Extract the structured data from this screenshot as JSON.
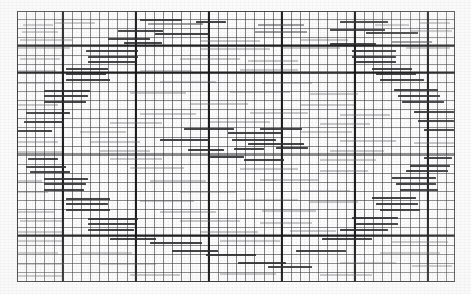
{
  "document": {
    "title": "Graph paper scan",
    "description": "Scanned engineering graph paper with hand-drawn horizontal step segments",
    "media_type": "scanned-image",
    "width": 471,
    "height": 294
  },
  "colors": {
    "background": "#fcfcfc",
    "minor_gridline": "#37373a",
    "major_gridline": "#121214",
    "segment_dark": "#2b2b2e",
    "segment_light": "#4a4a4e",
    "segment_faint": "#5c5c60"
  },
  "grid": {
    "plate_left": 17,
    "plate_top": 11,
    "plate_width": 438,
    "plate_height": 271,
    "minor_cell_w": 9.13,
    "minor_cell_h": 9.03,
    "major_cell_w": 73.05,
    "major_cell_h": 81.3,
    "major_offset_x": 44.9,
    "major_offset_y": 35.5
  },
  "chart_data": {
    "type": "line",
    "title": "",
    "xlabel": "",
    "ylabel": "",
    "grid": true,
    "legend": "none",
    "xlim": [
      0,
      48
    ],
    "ylim": [
      0,
      30
    ],
    "series": [
      {
        "name": "upper-staircase",
        "steps": [
          {
            "x0": 2,
            "x1": 7,
            "y": 26
          },
          {
            "x0": 3,
            "x1": 8,
            "y": 25
          },
          {
            "x0": 5,
            "x1": 10,
            "y": 24
          },
          {
            "x0": 7,
            "x1": 12,
            "y": 23
          },
          {
            "x0": 9,
            "x1": 14,
            "y": 22
          },
          {
            "x0": 11,
            "x1": 17,
            "y": 21
          },
          {
            "x0": 13,
            "x1": 19,
            "y": 20
          },
          {
            "x0": 16,
            "x1": 22,
            "y": 19
          },
          {
            "x0": 19,
            "x1": 25,
            "y": 18
          },
          {
            "x0": 21,
            "x1": 27,
            "y": 17
          },
          {
            "x0": 24,
            "x1": 30,
            "y": 16
          },
          {
            "x0": 27,
            "x1": 33,
            "y": 15
          },
          {
            "x0": 30,
            "x1": 36,
            "y": 14
          }
        ]
      },
      {
        "name": "plateau",
        "steps": [
          {
            "x0": 33,
            "x1": 41,
            "y": 13
          },
          {
            "x0": 36,
            "x1": 44,
            "y": 12
          }
        ]
      },
      {
        "name": "descending-staircase",
        "steps": [
          {
            "x0": 28,
            "x1": 34,
            "y": 11
          },
          {
            "x0": 31,
            "x1": 37,
            "y": 10
          },
          {
            "x0": 34,
            "x1": 40,
            "y": 9
          },
          {
            "x0": 37,
            "x1": 43,
            "y": 8
          },
          {
            "x0": 40,
            "x1": 46,
            "y": 7
          }
        ]
      }
    ]
  },
  "segments": [
    {
      "x": 23,
      "y": 24,
      "w": 30,
      "h": 2,
      "tone": "faint"
    },
    {
      "x": 55,
      "y": 22,
      "w": 40,
      "h": 2,
      "tone": "faint"
    },
    {
      "x": 140,
      "y": 19,
      "w": 42,
      "h": 2,
      "tone": "dark"
    },
    {
      "x": 148,
      "y": 23,
      "w": 55,
      "h": 2,
      "tone": "light"
    },
    {
      "x": 196,
      "y": 21,
      "w": 30,
      "h": 2,
      "tone": "dark"
    },
    {
      "x": 258,
      "y": 24,
      "w": 46,
      "h": 2,
      "tone": "light"
    },
    {
      "x": 340,
      "y": 21,
      "w": 48,
      "h": 2,
      "tone": "dark"
    },
    {
      "x": 375,
      "y": 24,
      "w": 34,
      "h": 2,
      "tone": "faint"
    },
    {
      "x": 420,
      "y": 22,
      "w": 30,
      "h": 2,
      "tone": "faint"
    },
    {
      "x": 22,
      "y": 31,
      "w": 36,
      "h": 2,
      "tone": "faint"
    },
    {
      "x": 118,
      "y": 30,
      "w": 45,
      "h": 2,
      "tone": "dark"
    },
    {
      "x": 155,
      "y": 33,
      "w": 54,
      "h": 2,
      "tone": "dark"
    },
    {
      "x": 255,
      "y": 31,
      "w": 52,
      "h": 2,
      "tone": "light"
    },
    {
      "x": 330,
      "y": 29,
      "w": 55,
      "h": 2,
      "tone": "dark"
    },
    {
      "x": 366,
      "y": 32,
      "w": 52,
      "h": 2,
      "tone": "dark"
    },
    {
      "x": 410,
      "y": 30,
      "w": 42,
      "h": 2,
      "tone": "faint"
    },
    {
      "x": 20,
      "y": 39,
      "w": 52,
      "h": 2,
      "tone": "faint"
    },
    {
      "x": 108,
      "y": 38,
      "w": 42,
      "h": 2,
      "tone": "dark"
    },
    {
      "x": 124,
      "y": 42,
      "w": 38,
      "h": 2,
      "tone": "dark"
    },
    {
      "x": 200,
      "y": 40,
      "w": 60,
      "h": 2,
      "tone": "faint"
    },
    {
      "x": 300,
      "y": 39,
      "w": 48,
      "h": 2,
      "tone": "faint"
    },
    {
      "x": 330,
      "y": 43,
      "w": 46,
      "h": 2,
      "tone": "dark"
    },
    {
      "x": 392,
      "y": 41,
      "w": 40,
      "h": 2,
      "tone": "light"
    },
    {
      "x": 18,
      "y": 47,
      "w": 52,
      "h": 2,
      "tone": "faint"
    },
    {
      "x": 86,
      "y": 50,
      "w": 52,
      "h": 2,
      "tone": "dark"
    },
    {
      "x": 200,
      "y": 48,
      "w": 70,
      "h": 2,
      "tone": "faint"
    },
    {
      "x": 282,
      "y": 47,
      "w": 58,
      "h": 2,
      "tone": "faint"
    },
    {
      "x": 352,
      "y": 50,
      "w": 44,
      "h": 2,
      "tone": "dark"
    },
    {
      "x": 406,
      "y": 47,
      "w": 44,
      "h": 2,
      "tone": "faint"
    },
    {
      "x": 88,
      "y": 56,
      "w": 50,
      "h": 2,
      "tone": "dark"
    },
    {
      "x": 352,
      "y": 56,
      "w": 44,
      "h": 2,
      "tone": "dark"
    },
    {
      "x": 88,
      "y": 61,
      "w": 48,
      "h": 2,
      "tone": "dark"
    },
    {
      "x": 356,
      "y": 61,
      "w": 40,
      "h": 2,
      "tone": "dark"
    },
    {
      "x": 20,
      "y": 58,
      "w": 40,
      "h": 2,
      "tone": "faint"
    },
    {
      "x": 180,
      "y": 58,
      "w": 60,
      "h": 2,
      "tone": "faint"
    },
    {
      "x": 248,
      "y": 60,
      "w": 50,
      "h": 2,
      "tone": "faint"
    },
    {
      "x": 66,
      "y": 68,
      "w": 42,
      "h": 2,
      "tone": "dark"
    },
    {
      "x": 66,
      "y": 73,
      "w": 40,
      "h": 2,
      "tone": "dark"
    },
    {
      "x": 372,
      "y": 68,
      "w": 40,
      "h": 2,
      "tone": "dark"
    },
    {
      "x": 376,
      "y": 73,
      "w": 40,
      "h": 2,
      "tone": "dark"
    },
    {
      "x": 18,
      "y": 70,
      "w": 38,
      "h": 2,
      "tone": "faint"
    },
    {
      "x": 140,
      "y": 70,
      "w": 52,
      "h": 2,
      "tone": "faint"
    },
    {
      "x": 240,
      "y": 69,
      "w": 58,
      "h": 2,
      "tone": "faint"
    },
    {
      "x": 300,
      "y": 72,
      "w": 46,
      "h": 2,
      "tone": "faint"
    },
    {
      "x": 66,
      "y": 79,
      "w": 44,
      "h": 2,
      "tone": "dark"
    },
    {
      "x": 380,
      "y": 79,
      "w": 44,
      "h": 2,
      "tone": "dark"
    },
    {
      "x": 18,
      "y": 82,
      "w": 44,
      "h": 2,
      "tone": "faint"
    },
    {
      "x": 160,
      "y": 81,
      "w": 56,
      "h": 2,
      "tone": "faint"
    },
    {
      "x": 262,
      "y": 82,
      "w": 50,
      "h": 2,
      "tone": "faint"
    },
    {
      "x": 44,
      "y": 90,
      "w": 46,
      "h": 2,
      "tone": "dark"
    },
    {
      "x": 394,
      "y": 89,
      "w": 44,
      "h": 2,
      "tone": "dark"
    },
    {
      "x": 44,
      "y": 95,
      "w": 44,
      "h": 2,
      "tone": "dark"
    },
    {
      "x": 398,
      "y": 95,
      "w": 42,
      "h": 2,
      "tone": "dark"
    },
    {
      "x": 130,
      "y": 92,
      "w": 56,
      "h": 2,
      "tone": "faint"
    },
    {
      "x": 230,
      "y": 91,
      "w": 60,
      "h": 2,
      "tone": "faint"
    },
    {
      "x": 310,
      "y": 93,
      "w": 48,
      "h": 2,
      "tone": "faint"
    },
    {
      "x": 44,
      "y": 101,
      "w": 42,
      "h": 2,
      "tone": "dark"
    },
    {
      "x": 402,
      "y": 101,
      "w": 42,
      "h": 2,
      "tone": "dark"
    },
    {
      "x": 18,
      "y": 104,
      "w": 40,
      "h": 2,
      "tone": "faint"
    },
    {
      "x": 190,
      "y": 103,
      "w": 58,
      "h": 2,
      "tone": "faint"
    },
    {
      "x": 300,
      "y": 104,
      "w": 54,
      "h": 2,
      "tone": "faint"
    },
    {
      "x": 26,
      "y": 112,
      "w": 44,
      "h": 2,
      "tone": "dark"
    },
    {
      "x": 414,
      "y": 111,
      "w": 40,
      "h": 2,
      "tone": "dark"
    },
    {
      "x": 140,
      "y": 113,
      "w": 56,
      "h": 2,
      "tone": "faint"
    },
    {
      "x": 250,
      "y": 112,
      "w": 58,
      "h": 2,
      "tone": "faint"
    },
    {
      "x": 340,
      "y": 114,
      "w": 50,
      "h": 2,
      "tone": "faint"
    },
    {
      "x": 24,
      "y": 121,
      "w": 40,
      "h": 2,
      "tone": "dark"
    },
    {
      "x": 418,
      "y": 120,
      "w": 36,
      "h": 2,
      "tone": "dark"
    },
    {
      "x": 110,
      "y": 122,
      "w": 52,
      "h": 2,
      "tone": "faint"
    },
    {
      "x": 210,
      "y": 121,
      "w": 60,
      "h": 2,
      "tone": "faint"
    },
    {
      "x": 320,
      "y": 123,
      "w": 50,
      "h": 2,
      "tone": "faint"
    },
    {
      "x": 18,
      "y": 130,
      "w": 34,
      "h": 2,
      "tone": "dark"
    },
    {
      "x": 184,
      "y": 128,
      "w": 50,
      "h": 2,
      "tone": "dark"
    },
    {
      "x": 228,
      "y": 132,
      "w": 54,
      "h": 2,
      "tone": "dark"
    },
    {
      "x": 260,
      "y": 128,
      "w": 42,
      "h": 2,
      "tone": "dark"
    },
    {
      "x": 424,
      "y": 129,
      "w": 30,
      "h": 2,
      "tone": "dark"
    },
    {
      "x": 80,
      "y": 131,
      "w": 46,
      "h": 2,
      "tone": "faint"
    },
    {
      "x": 300,
      "y": 131,
      "w": 52,
      "h": 2,
      "tone": "faint"
    },
    {
      "x": 160,
      "y": 139,
      "w": 50,
      "h": 2,
      "tone": "dark"
    },
    {
      "x": 232,
      "y": 139,
      "w": 44,
      "h": 2,
      "tone": "dark"
    },
    {
      "x": 248,
      "y": 143,
      "w": 56,
      "h": 2,
      "tone": "dark"
    },
    {
      "x": 18,
      "y": 141,
      "w": 40,
      "h": 2,
      "tone": "faint"
    },
    {
      "x": 90,
      "y": 141,
      "w": 50,
      "h": 2,
      "tone": "faint"
    },
    {
      "x": 340,
      "y": 140,
      "w": 56,
      "h": 2,
      "tone": "faint"
    },
    {
      "x": 414,
      "y": 142,
      "w": 40,
      "h": 2,
      "tone": "faint"
    },
    {
      "x": 188,
      "y": 149,
      "w": 36,
      "h": 2,
      "tone": "dark"
    },
    {
      "x": 234,
      "y": 148,
      "w": 30,
      "h": 2,
      "tone": "dark"
    },
    {
      "x": 276,
      "y": 147,
      "w": 32,
      "h": 2,
      "tone": "dark"
    },
    {
      "x": 18,
      "y": 151,
      "w": 44,
      "h": 2,
      "tone": "faint"
    },
    {
      "x": 100,
      "y": 150,
      "w": 50,
      "h": 2,
      "tone": "faint"
    },
    {
      "x": 330,
      "y": 150,
      "w": 54,
      "h": 2,
      "tone": "faint"
    },
    {
      "x": 210,
      "y": 156,
      "w": 34,
      "h": 2,
      "tone": "dark"
    },
    {
      "x": 244,
      "y": 159,
      "w": 40,
      "h": 2,
      "tone": "dark"
    },
    {
      "x": 28,
      "y": 158,
      "w": 30,
      "h": 2,
      "tone": "dark"
    },
    {
      "x": 424,
      "y": 157,
      "w": 28,
      "h": 2,
      "tone": "dark"
    },
    {
      "x": 110,
      "y": 158,
      "w": 52,
      "h": 2,
      "tone": "faint"
    },
    {
      "x": 320,
      "y": 159,
      "w": 56,
      "h": 2,
      "tone": "faint"
    },
    {
      "x": 26,
      "y": 166,
      "w": 40,
      "h": 2,
      "tone": "dark"
    },
    {
      "x": 30,
      "y": 171,
      "w": 40,
      "h": 2,
      "tone": "dark"
    },
    {
      "x": 410,
      "y": 165,
      "w": 40,
      "h": 2,
      "tone": "dark"
    },
    {
      "x": 406,
      "y": 170,
      "w": 42,
      "h": 2,
      "tone": "dark"
    },
    {
      "x": 130,
      "y": 167,
      "w": 54,
      "h": 2,
      "tone": "faint"
    },
    {
      "x": 240,
      "y": 168,
      "w": 58,
      "h": 2,
      "tone": "faint"
    },
    {
      "x": 320,
      "y": 170,
      "w": 48,
      "h": 2,
      "tone": "faint"
    },
    {
      "x": 44,
      "y": 178,
      "w": 44,
      "h": 2,
      "tone": "dark"
    },
    {
      "x": 392,
      "y": 177,
      "w": 44,
      "h": 2,
      "tone": "dark"
    },
    {
      "x": 44,
      "y": 183,
      "w": 42,
      "h": 2,
      "tone": "dark"
    },
    {
      "x": 396,
      "y": 183,
      "w": 40,
      "h": 2,
      "tone": "dark"
    },
    {
      "x": 18,
      "y": 180,
      "w": 24,
      "h": 2,
      "tone": "faint"
    },
    {
      "x": 150,
      "y": 180,
      "w": 56,
      "h": 2,
      "tone": "faint"
    },
    {
      "x": 260,
      "y": 179,
      "w": 58,
      "h": 2,
      "tone": "faint"
    },
    {
      "x": 44,
      "y": 189,
      "w": 40,
      "h": 2,
      "tone": "dark"
    },
    {
      "x": 400,
      "y": 189,
      "w": 38,
      "h": 2,
      "tone": "dark"
    },
    {
      "x": 18,
      "y": 191,
      "w": 30,
      "h": 2,
      "tone": "faint"
    },
    {
      "x": 180,
      "y": 191,
      "w": 56,
      "h": 2,
      "tone": "faint"
    },
    {
      "x": 300,
      "y": 190,
      "w": 50,
      "h": 2,
      "tone": "faint"
    },
    {
      "x": 66,
      "y": 198,
      "w": 44,
      "h": 2,
      "tone": "dark"
    },
    {
      "x": 372,
      "y": 197,
      "w": 44,
      "h": 2,
      "tone": "dark"
    },
    {
      "x": 66,
      "y": 203,
      "w": 42,
      "h": 2,
      "tone": "dark"
    },
    {
      "x": 376,
      "y": 203,
      "w": 42,
      "h": 2,
      "tone": "dark"
    },
    {
      "x": 140,
      "y": 200,
      "w": 54,
      "h": 2,
      "tone": "faint"
    },
    {
      "x": 240,
      "y": 199,
      "w": 58,
      "h": 2,
      "tone": "faint"
    },
    {
      "x": 310,
      "y": 201,
      "w": 48,
      "h": 2,
      "tone": "faint"
    },
    {
      "x": 66,
      "y": 209,
      "w": 44,
      "h": 2,
      "tone": "dark"
    },
    {
      "x": 380,
      "y": 209,
      "w": 40,
      "h": 2,
      "tone": "dark"
    },
    {
      "x": 18,
      "y": 211,
      "w": 36,
      "h": 2,
      "tone": "faint"
    },
    {
      "x": 160,
      "y": 211,
      "w": 56,
      "h": 2,
      "tone": "faint"
    },
    {
      "x": 262,
      "y": 210,
      "w": 54,
      "h": 2,
      "tone": "faint"
    },
    {
      "x": 88,
      "y": 218,
      "w": 50,
      "h": 2,
      "tone": "dark"
    },
    {
      "x": 352,
      "y": 217,
      "w": 46,
      "h": 2,
      "tone": "dark"
    },
    {
      "x": 88,
      "y": 223,
      "w": 48,
      "h": 2,
      "tone": "dark"
    },
    {
      "x": 356,
      "y": 223,
      "w": 42,
      "h": 2,
      "tone": "dark"
    },
    {
      "x": 20,
      "y": 220,
      "w": 42,
      "h": 2,
      "tone": "faint"
    },
    {
      "x": 180,
      "y": 220,
      "w": 60,
      "h": 2,
      "tone": "faint"
    },
    {
      "x": 260,
      "y": 222,
      "w": 52,
      "h": 2,
      "tone": "faint"
    },
    {
      "x": 88,
      "y": 229,
      "w": 46,
      "h": 2,
      "tone": "dark"
    },
    {
      "x": 340,
      "y": 229,
      "w": 48,
      "h": 2,
      "tone": "dark"
    },
    {
      "x": 18,
      "y": 231,
      "w": 44,
      "h": 2,
      "tone": "faint"
    },
    {
      "x": 200,
      "y": 231,
      "w": 58,
      "h": 2,
      "tone": "faint"
    },
    {
      "x": 290,
      "y": 230,
      "w": 46,
      "h": 2,
      "tone": "faint"
    },
    {
      "x": 110,
      "y": 238,
      "w": 46,
      "h": 2,
      "tone": "dark"
    },
    {
      "x": 150,
      "y": 242,
      "w": 52,
      "h": 2,
      "tone": "dark"
    },
    {
      "x": 322,
      "y": 238,
      "w": 50,
      "h": 2,
      "tone": "dark"
    },
    {
      "x": 18,
      "y": 240,
      "w": 44,
      "h": 2,
      "tone": "faint"
    },
    {
      "x": 220,
      "y": 240,
      "w": 60,
      "h": 2,
      "tone": "faint"
    },
    {
      "x": 392,
      "y": 241,
      "w": 56,
      "h": 2,
      "tone": "faint"
    },
    {
      "x": 172,
      "y": 250,
      "w": 46,
      "h": 2,
      "tone": "dark"
    },
    {
      "x": 206,
      "y": 254,
      "w": 50,
      "h": 2,
      "tone": "dark"
    },
    {
      "x": 296,
      "y": 250,
      "w": 50,
      "h": 2,
      "tone": "dark"
    },
    {
      "x": 18,
      "y": 252,
      "w": 40,
      "h": 2,
      "tone": "faint"
    },
    {
      "x": 80,
      "y": 252,
      "w": 52,
      "h": 2,
      "tone": "faint"
    },
    {
      "x": 380,
      "y": 252,
      "w": 60,
      "h": 2,
      "tone": "faint"
    },
    {
      "x": 238,
      "y": 262,
      "w": 48,
      "h": 2,
      "tone": "dark"
    },
    {
      "x": 268,
      "y": 266,
      "w": 44,
      "h": 2,
      "tone": "dark"
    },
    {
      "x": 18,
      "y": 263,
      "w": 46,
      "h": 2,
      "tone": "faint"
    },
    {
      "x": 100,
      "y": 263,
      "w": 56,
      "h": 2,
      "tone": "faint"
    },
    {
      "x": 340,
      "y": 262,
      "w": 56,
      "h": 2,
      "tone": "faint"
    },
    {
      "x": 412,
      "y": 265,
      "w": 40,
      "h": 2,
      "tone": "faint"
    },
    {
      "x": 130,
      "y": 274,
      "w": 50,
      "h": 2,
      "tone": "faint"
    },
    {
      "x": 220,
      "y": 273,
      "w": 56,
      "h": 2,
      "tone": "faint"
    },
    {
      "x": 320,
      "y": 274,
      "w": 52,
      "h": 2,
      "tone": "faint"
    },
    {
      "x": 18,
      "y": 275,
      "w": 44,
      "h": 2,
      "tone": "faint"
    }
  ]
}
